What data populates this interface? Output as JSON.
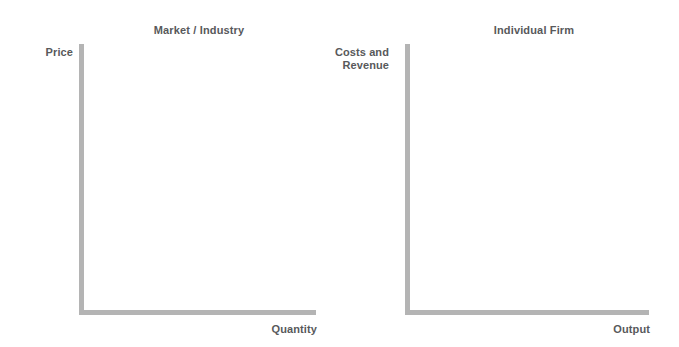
{
  "figure": {
    "background_color": "#ffffff",
    "axis_color": "#b4b4b4",
    "text_color": "#58595b"
  },
  "charts": [
    {
      "id": "market",
      "title": "Market / Industry",
      "ylabel": "Price",
      "xlabel": "Quantity"
    },
    {
      "id": "firm",
      "title": "Individual Firm",
      "ylabel_line1": "Costs and",
      "ylabel_line2": "Revenue",
      "xlabel": "Output"
    }
  ],
  "chart_data": [
    {
      "type": "line",
      "title": "Market / Industry",
      "xlabel": "Quantity",
      "ylabel": "Price",
      "series": [],
      "x": [],
      "values": [],
      "tick_labels": {
        "x": [],
        "y": []
      },
      "xlim": [
        0,
        1
      ],
      "ylim": [
        0,
        1
      ],
      "grid": false,
      "legend": false,
      "annotations": [],
      "note": "Empty axes template: L-shaped axes with no plotted data, no tick marks and no tick labels."
    },
    {
      "type": "line",
      "title": "Individual Firm",
      "xlabel": "Output",
      "ylabel": "Costs and Revenue",
      "series": [],
      "x": [],
      "values": [],
      "tick_labels": {
        "x": [],
        "y": []
      },
      "xlim": [
        0,
        1
      ],
      "ylim": [
        0,
        1
      ],
      "grid": false,
      "legend": false,
      "annotations": [],
      "note": "Empty axes template: L-shaped axes with no plotted data, no tick marks and no tick labels."
    }
  ]
}
